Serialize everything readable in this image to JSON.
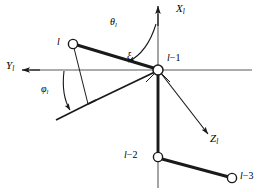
{
  "figure": {
    "type": "kinematic-chain-coordinate-diagram",
    "background_color": "#ffffff",
    "stroke_color": "#1a1a1a",
    "axis_color": "#555555",
    "width": 260,
    "height": 192
  },
  "axes": [
    {
      "id": "x-axis",
      "label_base": "X",
      "label_sub": "l",
      "direction": "up",
      "label_x": 176,
      "label_y": 4
    },
    {
      "id": "y-axis",
      "label_base": "Y",
      "label_sub": "l",
      "direction": "left",
      "label_x": 6,
      "label_y": 62
    },
    {
      "id": "z-axis",
      "label_base": "Z",
      "label_sub": "l",
      "direction": "down-right",
      "label_x": 208,
      "label_y": 133
    }
  ],
  "angles": [
    {
      "id": "theta",
      "symbol": "θ",
      "sub": "l",
      "label_x": 110,
      "label_y": 18
    },
    {
      "id": "phi",
      "symbol": "φ",
      "sub": "l",
      "label_x": 41,
      "label_y": 85
    }
  ],
  "segments": [
    {
      "id": "xi",
      "symbol": "ξ",
      "sub": "l",
      "label_x": 127,
      "label_y": 53
    }
  ],
  "nodes": [
    {
      "id": "node-l",
      "base": "l",
      "suffix": "",
      "cx": 73,
      "cy": 44,
      "r": 4.6,
      "label_x": 58,
      "label_y": 38,
      "label_align": "right"
    },
    {
      "id": "node-l-minus-1",
      "base": "l",
      "suffix": "−1",
      "cx": 158,
      "cy": 70,
      "r": 5.0,
      "label_x": 166,
      "label_y": 54,
      "label_align": "left"
    },
    {
      "id": "node-l-minus-2",
      "base": "l",
      "suffix": "−2",
      "cx": 158,
      "cy": 157,
      "r": 4.6,
      "label_x": 125,
      "label_y": 150,
      "label_align": "right"
    },
    {
      "id": "node-l-minus-3",
      "base": "l",
      "suffix": "−3",
      "cx": 232,
      "cy": 178,
      "r": 4.6,
      "label_x": 240,
      "label_y": 172,
      "label_align": "left"
    }
  ]
}
